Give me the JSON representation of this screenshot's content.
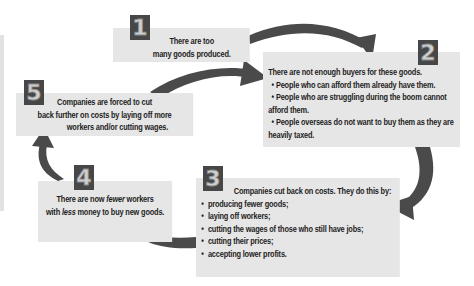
{
  "diagram": {
    "type": "cycle",
    "colors": {
      "box_fill": "#e6e6e6",
      "badge_fill": "#474747",
      "arrow": "#4a4a4a",
      "text": "#1e1e1e"
    },
    "steps": [
      {
        "number": "1",
        "lines": [
          "There are too",
          "many goods produced."
        ]
      },
      {
        "number": "2",
        "title": "There are not enough buyers for these goods.",
        "bullets": [
          "• People who can afford them already have them.",
          "• People who are struggling during the boom cannot",
          "afford them.",
          "• People overseas do not want to buy them as they are",
          "heavily taxed."
        ]
      },
      {
        "number": "3",
        "title": "Companies cut back on costs. They do this by:",
        "bullets": [
          "producing fewer goods;",
          "laying off workers;",
          "cutting the wages of those who still have jobs;",
          "cutting their prices;",
          "accepting lower profits."
        ]
      },
      {
        "number": "4",
        "line1_a": "There are now ",
        "line1_em": "fewer",
        "line1_b": " workers",
        "line2_a": "with ",
        "line2_em": "less",
        "line2_b": " money to buy new goods."
      },
      {
        "number": "5",
        "lines": [
          "Companies are forced to cut",
          "back further on costs by laying off more",
          "workers and/or cutting wages."
        ]
      }
    ],
    "arrows": [
      "1→2",
      "5→2",
      "2→3",
      "3→4",
      "4→5"
    ]
  }
}
